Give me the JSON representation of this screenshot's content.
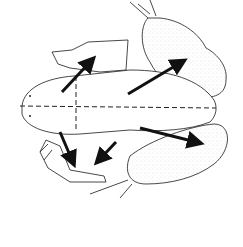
{
  "figure": {
    "background": "#ffffff",
    "line_color": "#1a1a1a",
    "stipple_color": "#9a9a9a",
    "arrow_color": "#111111",
    "arrows": [
      {
        "name": "arrow-front-left",
        "from": [
          62,
          92
        ],
        "to": [
          94,
          58
        ]
      },
      {
        "name": "arrow-hind-left",
        "from": [
          128,
          94
        ],
        "to": [
          186,
          60
        ]
      },
      {
        "name": "arrow-front-right-1",
        "from": [
          60,
          132
        ],
        "to": [
          74,
          164
        ]
      },
      {
        "name": "arrow-front-right-2",
        "from": [
          116,
          142
        ],
        "to": [
          98,
          162
        ]
      },
      {
        "name": "arrow-hind-right",
        "from": [
          140,
          128
        ],
        "to": [
          202,
          144
        ]
      }
    ],
    "axes": {
      "horizontal_dashed": true,
      "vertical_dashed": true
    }
  }
}
